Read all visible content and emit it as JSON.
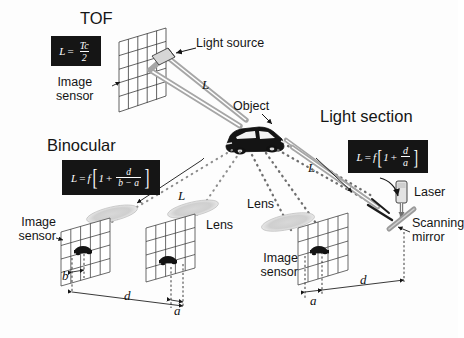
{
  "figure": {
    "type": "optical-ranging-methods-diagram",
    "background": "#fdfdfd",
    "ink": "#151515",
    "beam_gray": "#9a9a9a",
    "plate_bg": "#151515",
    "plate_fg": "#ffffff"
  },
  "titles": {
    "tof": "TOF",
    "binocular": "Binocular",
    "light_section": "Light section"
  },
  "formulas": {
    "tof": {
      "lhs": "L",
      "eq": "=",
      "numerator": "Tc",
      "denominator": "2"
    },
    "binocular": {
      "lhs": "L",
      "eq": "=",
      "f": "f",
      "bracket_open": "[",
      "one": "1",
      "plus": "+",
      "numerator": "d",
      "denominator": "b − a",
      "bracket_close": "]"
    },
    "light_section": {
      "lhs": "L",
      "eq": "=",
      "f": "f",
      "bracket_open": "[",
      "one": "1",
      "plus": "+",
      "numerator": "d",
      "denominator": "a",
      "bracket_close": "]"
    }
  },
  "labels": {
    "light_source": "Light source",
    "object": "Object",
    "laser": "Laser",
    "scanning_mirror": "Scanning\nmirror",
    "scanning_mirror_line1": "Scanning",
    "scanning_mirror_line2": "mirror",
    "image_sensor_tof_line1": "Image",
    "image_sensor_tof_line2": "sensor",
    "image_sensor_left_line1": "Image",
    "image_sensor_left_line2": "sensor",
    "image_sensor_center_line1": "Image",
    "image_sensor_center_line2": "sensor",
    "lens_binocular": "Lens",
    "lens_center": "Lens"
  },
  "math_symbols": {
    "L_tof": "L",
    "L_binocular": "L",
    "L_light_section": "L",
    "b_binocular": "b",
    "d_binocular": "d",
    "a_binocular": "a",
    "a_light_section": "a",
    "d_light_section": "d"
  },
  "elements": {
    "sensor_grids": 4,
    "lenses": 3,
    "object_is_car": true,
    "beams": [
      "tof-emit",
      "tof-return",
      "binocular-left-ray",
      "binocular-right-ray",
      "light-section-laser",
      "light-section-return"
    ]
  }
}
